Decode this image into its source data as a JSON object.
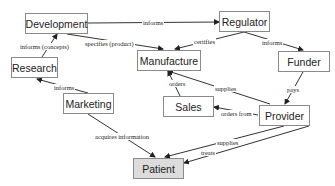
{
  "diagram": {
    "nodes": [
      {
        "id": "development",
        "label": "Development"
      },
      {
        "id": "regulator",
        "label": "Regulator"
      },
      {
        "id": "research",
        "label": "Research"
      },
      {
        "id": "manufacture",
        "label": "Manufacture"
      },
      {
        "id": "funder",
        "label": "Funder"
      },
      {
        "id": "sales",
        "label": "Sales"
      },
      {
        "id": "marketing",
        "label": "Marketing"
      },
      {
        "id": "provider",
        "label": "Provider"
      },
      {
        "id": "patient",
        "label": "Patient"
      }
    ],
    "edges": [
      {
        "from": "development",
        "to": "regulator",
        "label": "informs"
      },
      {
        "from": "research",
        "to": "development",
        "label": "informs (concepts)"
      },
      {
        "from": "development",
        "to": "manufacture",
        "label": "specifies (product)"
      },
      {
        "from": "regulator",
        "to": "manufacture",
        "label": "certifies"
      },
      {
        "from": "regulator",
        "to": "funder",
        "label": "informs"
      },
      {
        "from": "marketing",
        "to": "research",
        "label": "informs"
      },
      {
        "from": "sales",
        "to": "manufacture",
        "label": "orders"
      },
      {
        "from": "provider",
        "to": "manufacture",
        "label": "supplies"
      },
      {
        "from": "funder",
        "to": "provider",
        "label": "pays"
      },
      {
        "from": "provider",
        "to": "sales",
        "label": "orders from"
      },
      {
        "from": "marketing",
        "to": "patient",
        "label": "acquires information"
      },
      {
        "from": "provider",
        "to": "patient",
        "label": "supplies"
      },
      {
        "from": "patient",
        "to": "provider",
        "label": "treats"
      }
    ]
  }
}
